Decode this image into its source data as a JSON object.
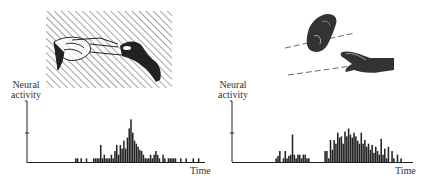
{
  "figure": {
    "left_panel": {
      "scene": "observer-hand-hidden-by-screen-grasping-object",
      "ylabel_line1": "Neural",
      "ylabel_line2": "activity",
      "xlabel": "Time"
    },
    "right_panel": {
      "scene": "two-hands-object-transfer",
      "ylabel_line1": "Neural",
      "ylabel_line2": "activity",
      "xlabel": "Time"
    },
    "colors": {
      "ink": "#222222",
      "background": "#ffffff",
      "hatch": "#555555"
    }
  },
  "chart_data": [
    {
      "type": "bar",
      "title": "",
      "xlabel": "Time",
      "ylabel": "Neural activity",
      "grid": false,
      "ylim": [
        0,
        1
      ],
      "x_range": [
        0,
        100
      ],
      "bars": [
        {
          "x": 27,
          "h": 0.06
        },
        {
          "x": 28,
          "h": 0.06
        },
        {
          "x": 30,
          "h": 0.06
        },
        {
          "x": 33,
          "h": 0.06
        },
        {
          "x": 37,
          "h": 0.06
        },
        {
          "x": 38,
          "h": 0.06
        },
        {
          "x": 39,
          "h": 0.06
        },
        {
          "x": 40,
          "h": 0.06
        },
        {
          "x": 41,
          "h": 0.28
        },
        {
          "x": 42,
          "h": 0.06
        },
        {
          "x": 43,
          "h": 0.12
        },
        {
          "x": 44,
          "h": 0.06
        },
        {
          "x": 45,
          "h": 0.06
        },
        {
          "x": 46,
          "h": 0.06
        },
        {
          "x": 47,
          "h": 0.12
        },
        {
          "x": 48,
          "h": 0.06
        },
        {
          "x": 49,
          "h": 0.18
        },
        {
          "x": 50,
          "h": 0.28
        },
        {
          "x": 51,
          "h": 0.12
        },
        {
          "x": 52,
          "h": 0.28
        },
        {
          "x": 53,
          "h": 0.22
        },
        {
          "x": 54,
          "h": 0.35
        },
        {
          "x": 55,
          "h": 0.22
        },
        {
          "x": 56,
          "h": 0.4
        },
        {
          "x": 57,
          "h": 0.55
        },
        {
          "x": 58,
          "h": 0.7
        },
        {
          "x": 59,
          "h": 0.48
        },
        {
          "x": 60,
          "h": 0.35
        },
        {
          "x": 61,
          "h": 0.3
        },
        {
          "x": 62,
          "h": 0.25
        },
        {
          "x": 63,
          "h": 0.2
        },
        {
          "x": 64,
          "h": 0.18
        },
        {
          "x": 65,
          "h": 0.12
        },
        {
          "x": 66,
          "h": 0.06
        },
        {
          "x": 67,
          "h": 0.06
        },
        {
          "x": 68,
          "h": 0.06
        },
        {
          "x": 69,
          "h": 0.12
        },
        {
          "x": 70,
          "h": 0.06
        },
        {
          "x": 71,
          "h": 0.12
        },
        {
          "x": 72,
          "h": 0.18
        },
        {
          "x": 73,
          "h": 0.12
        },
        {
          "x": 74,
          "h": 0.06
        },
        {
          "x": 76,
          "h": 0.12
        },
        {
          "x": 77,
          "h": 0.06
        },
        {
          "x": 79,
          "h": 0.06
        },
        {
          "x": 80,
          "h": 0.06
        },
        {
          "x": 81,
          "h": 0.06
        },
        {
          "x": 82,
          "h": 0.06
        },
        {
          "x": 83,
          "h": 0.06
        },
        {
          "x": 86,
          "h": 0.06
        },
        {
          "x": 89,
          "h": 0.06
        },
        {
          "x": 93,
          "h": 0.06
        },
        {
          "x": 96,
          "h": 0.06
        }
      ]
    },
    {
      "type": "bar",
      "title": "",
      "xlabel": "Time",
      "ylabel": "Neural activity",
      "grid": false,
      "ylim": [
        0,
        1
      ],
      "x_range": [
        0,
        100
      ],
      "bars": [
        {
          "x": 24,
          "h": 0.06
        },
        {
          "x": 25,
          "h": 0.1
        },
        {
          "x": 26,
          "h": 0.18
        },
        {
          "x": 28,
          "h": 0.06
        },
        {
          "x": 29,
          "h": 0.18
        },
        {
          "x": 30,
          "h": 0.06
        },
        {
          "x": 31,
          "h": 0.1
        },
        {
          "x": 32,
          "h": 0.12
        },
        {
          "x": 33,
          "h": 0.45
        },
        {
          "x": 34,
          "h": 0.12
        },
        {
          "x": 35,
          "h": 0.06
        },
        {
          "x": 36,
          "h": 0.12
        },
        {
          "x": 37,
          "h": 0.12
        },
        {
          "x": 38,
          "h": 0.06
        },
        {
          "x": 39,
          "h": 0.12
        },
        {
          "x": 40,
          "h": 0.12
        },
        {
          "x": 41,
          "h": 0.06
        },
        {
          "x": 42,
          "h": 0.06
        },
        {
          "x": 51,
          "h": 0.18
        },
        {
          "x": 52,
          "h": 0.18
        },
        {
          "x": 53,
          "h": 0.06
        },
        {
          "x": 54,
          "h": 0.36
        },
        {
          "x": 55,
          "h": 0.2
        },
        {
          "x": 56,
          "h": 0.36
        },
        {
          "x": 57,
          "h": 0.3
        },
        {
          "x": 58,
          "h": 0.48
        },
        {
          "x": 59,
          "h": 0.4
        },
        {
          "x": 60,
          "h": 0.42
        },
        {
          "x": 61,
          "h": 0.3
        },
        {
          "x": 62,
          "h": 0.5
        },
        {
          "x": 63,
          "h": 0.42
        },
        {
          "x": 64,
          "h": 0.55
        },
        {
          "x": 65,
          "h": 0.45
        },
        {
          "x": 66,
          "h": 0.4
        },
        {
          "x": 67,
          "h": 0.48
        },
        {
          "x": 68,
          "h": 0.42
        },
        {
          "x": 69,
          "h": 0.35
        },
        {
          "x": 70,
          "h": 0.3
        },
        {
          "x": 71,
          "h": 0.48
        },
        {
          "x": 72,
          "h": 0.3
        },
        {
          "x": 73,
          "h": 0.36
        },
        {
          "x": 74,
          "h": 0.25
        },
        {
          "x": 75,
          "h": 0.3
        },
        {
          "x": 76,
          "h": 0.2
        },
        {
          "x": 77,
          "h": 0.28
        },
        {
          "x": 78,
          "h": 0.15
        },
        {
          "x": 79,
          "h": 0.25
        },
        {
          "x": 80,
          "h": 0.18
        },
        {
          "x": 81,
          "h": 0.12
        },
        {
          "x": 82,
          "h": 0.38
        },
        {
          "x": 83,
          "h": 0.12
        },
        {
          "x": 84,
          "h": 0.22
        },
        {
          "x": 85,
          "h": 0.06
        },
        {
          "x": 86,
          "h": 0.25
        },
        {
          "x": 88,
          "h": 0.18
        },
        {
          "x": 89,
          "h": 0.06
        },
        {
          "x": 91,
          "h": 0.12
        },
        {
          "x": 93,
          "h": 0.06
        }
      ]
    }
  ]
}
